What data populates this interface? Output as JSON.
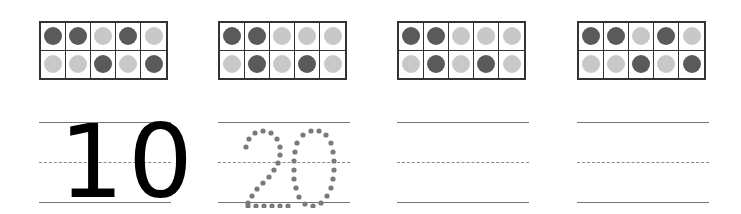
{
  "colors": {
    "dark_counter": "#5a5a5a",
    "light_counter": "#c8c8c8",
    "frame_border": "#333333",
    "writing_line": "#777777",
    "solid_digit": "#000000",
    "dotted_digit": "#7a7a7a"
  },
  "worksheet": {
    "blocks": [
      {
        "ten_frame": {
          "rows": [
            [
              "dark",
              "dark",
              "light",
              "dark",
              "light"
            ],
            [
              "light",
              "light",
              "dark",
              "light",
              "dark"
            ]
          ]
        },
        "writing": {
          "style": "solid",
          "text": "10"
        }
      },
      {
        "ten_frame": {
          "rows": [
            [
              "dark",
              "dark",
              "light",
              "light",
              "light"
            ],
            [
              "light",
              "dark",
              "light",
              "dark",
              "light"
            ]
          ]
        },
        "writing": {
          "style": "dotted",
          "text": "20"
        }
      },
      {
        "ten_frame": {
          "rows": [
            [
              "dark",
              "dark",
              "light",
              "light",
              "light"
            ],
            [
              "light",
              "dark",
              "light",
              "dark",
              "light"
            ]
          ]
        },
        "writing": {
          "style": "blank",
          "text": ""
        }
      },
      {
        "ten_frame": {
          "rows": [
            [
              "dark",
              "dark",
              "light",
              "dark",
              "light"
            ],
            [
              "light",
              "light",
              "dark",
              "light",
              "dark"
            ]
          ]
        },
        "writing": {
          "style": "blank",
          "text": ""
        }
      }
    ]
  }
}
